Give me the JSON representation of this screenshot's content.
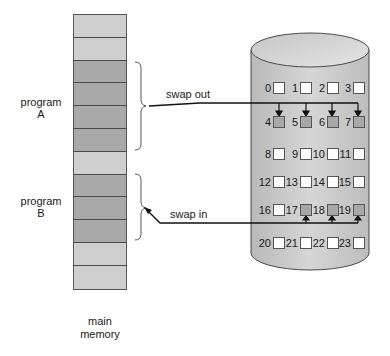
{
  "diagram": {
    "main_memory": {
      "label_line1": "main",
      "label_line2": "memory",
      "rows": [
        "free",
        "free",
        "used",
        "used",
        "used",
        "used",
        "free",
        "used",
        "used",
        "used",
        "free",
        "free"
      ]
    },
    "programs": [
      {
        "label_line1": "program",
        "label_line2": "A",
        "rows": [
          2,
          3,
          4,
          5
        ]
      },
      {
        "label_line1": "program",
        "label_line2": "B",
        "rows": [
          7,
          8,
          9
        ]
      }
    ],
    "arrows": {
      "swap_out": "swap out",
      "swap_in": "swap in"
    },
    "disk": {
      "blocks": [
        {
          "n": "0",
          "shaded": false
        },
        {
          "n": "1",
          "shaded": false
        },
        {
          "n": "2",
          "shaded": false
        },
        {
          "n": "3",
          "shaded": false
        },
        {
          "n": "4",
          "shaded": true
        },
        {
          "n": "5",
          "shaded": true
        },
        {
          "n": "6",
          "shaded": true
        },
        {
          "n": "7",
          "shaded": true
        },
        {
          "n": "8",
          "shaded": false
        },
        {
          "n": "9",
          "shaded": false
        },
        {
          "n": "10",
          "shaded": false
        },
        {
          "n": "11",
          "shaded": false
        },
        {
          "n": "12",
          "shaded": false
        },
        {
          "n": "13",
          "shaded": false
        },
        {
          "n": "14",
          "shaded": false
        },
        {
          "n": "15",
          "shaded": false
        },
        {
          "n": "16",
          "shaded": false
        },
        {
          "n": "17",
          "shaded": true
        },
        {
          "n": "18",
          "shaded": true
        },
        {
          "n": "19",
          "shaded": true
        },
        {
          "n": "20",
          "shaded": false
        },
        {
          "n": "21",
          "shaded": false
        },
        {
          "n": "22",
          "shaded": false
        },
        {
          "n": "23",
          "shaded": false
        }
      ],
      "swapped_out_blocks": [
        "4",
        "5",
        "6",
        "7"
      ],
      "swapped_in_blocks": [
        "17",
        "18",
        "19"
      ]
    },
    "colors": {
      "memory_free": "#cfcfcf",
      "memory_used": "#a9a9a9",
      "disk_body": "#c4c4c4",
      "block_shaded": "#a8a8a8",
      "block_empty": "#ffffff"
    }
  }
}
